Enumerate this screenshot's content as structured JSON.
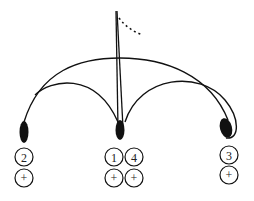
{
  "diagram": {
    "flag": {
      "label": ""
    },
    "nodes": [
      {
        "id": "left",
        "cx": 24,
        "cy": 132,
        "rx": 4.5,
        "ry": 11
      },
      {
        "id": "middle",
        "cx": 120,
        "cy": 130,
        "rx": 4.5,
        "ry": 10
      },
      {
        "id": "right",
        "cx": 226,
        "cy": 128,
        "rx": 6,
        "ry": 10,
        "rotate": -15
      }
    ],
    "circles": [
      {
        "cx": 24,
        "cy": 157,
        "text": "2"
      },
      {
        "cx": 24,
        "cy": 178,
        "text": "+"
      },
      {
        "cx": 114,
        "cy": 157,
        "text": "1"
      },
      {
        "cx": 134,
        "cy": 157,
        "text": "4"
      },
      {
        "cx": 114,
        "cy": 178,
        "text": "+"
      },
      {
        "cx": 134,
        "cy": 178,
        "text": "+"
      },
      {
        "cx": 229,
        "cy": 155,
        "text": "3"
      },
      {
        "cx": 229,
        "cy": 175,
        "text": "+"
      }
    ],
    "colors": {
      "stroke": "#111111",
      "background": "#ffffff"
    }
  }
}
